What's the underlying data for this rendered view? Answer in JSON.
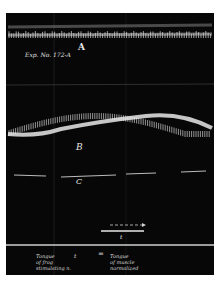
{
  "figure": {
    "plate_color": "#070707",
    "trace_color": "#e8e8e8",
    "background": "#ffffff",
    "annotation": "Exp. No. 172-A",
    "traces": [
      {
        "id": "A",
        "label": "A",
        "kind": "dense-oscillation"
      },
      {
        "id": "B",
        "label": "B",
        "kind": "oscillation-on-slow-wave"
      },
      {
        "id": "C",
        "label": "C",
        "kind": "baseline-dashed"
      }
    ],
    "time_marker": {
      "label": "t",
      "arrow": "→"
    },
    "legend": {
      "left": "Tongue\nof frog\nstimulating n.",
      "mid": "t",
      "eq": "=",
      "right": "Tongue\nof muscle\nnormalized"
    }
  }
}
